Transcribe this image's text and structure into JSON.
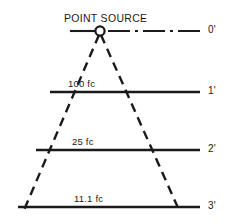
{
  "figure": {
    "title": "POINT SOURCE",
    "background_color": "#ffffff",
    "ink_color": "#1a1a1a"
  },
  "source": {
    "marker_name": "point-source-circle",
    "x": 100,
    "y": 31,
    "radius": 4.6
  },
  "axis": {
    "style": "dash-dot",
    "label": "0'",
    "y": 31,
    "x_start": 70,
    "x_end": 200
  },
  "planes": [
    {
      "distance_label": "1'",
      "illuminance_label": "100 fc",
      "y": 92,
      "x_start": 50,
      "x_end": 200,
      "label_x": 68,
      "label_y": 79
    },
    {
      "distance_label": "2'",
      "illuminance_label": "25 fc",
      "y": 150,
      "x_start": 36,
      "x_end": 200,
      "label_x": 72,
      "label_y": 137
    },
    {
      "distance_label": "3'",
      "illuminance_label": "11.1 fc",
      "y": 207,
      "x_start": 18,
      "x_end": 200,
      "label_x": 74,
      "label_y": 194
    }
  ],
  "rays": [
    {
      "name": "left-ray",
      "style": "dashed",
      "x1": 99,
      "y1": 35,
      "x2": 24,
      "y2": 210
    },
    {
      "name": "right-ray",
      "style": "dashed",
      "x1": 101,
      "y1": 35,
      "x2": 179,
      "y2": 210
    }
  ],
  "distance_labels_x": 208,
  "chart_data": {
    "type": "diagram",
    "title": "POINT SOURCE",
    "categories": [
      "0'",
      "1'",
      "2'",
      "3'"
    ],
    "values": [
      null,
      100,
      25,
      11.1
    ],
    "value_labels": [
      "",
      "100 fc",
      "25 fc",
      "11.1 fc"
    ],
    "xlabel": "",
    "ylabel": "Illuminance (fc)"
  }
}
